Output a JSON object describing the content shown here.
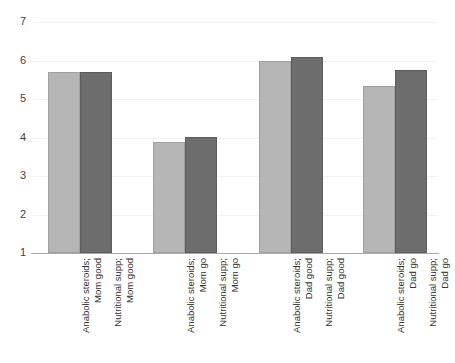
{
  "chart_data": {
    "type": "bar",
    "title": "",
    "subtitle": "",
    "xlabel": "",
    "ylabel": "",
    "ylim": [
      1,
      7
    ],
    "yticks": [
      1,
      2,
      3,
      4,
      5,
      6,
      7
    ],
    "ytick_labels": [
      "1",
      "2",
      "3",
      "4",
      "5",
      "6",
      "7"
    ],
    "grid": true,
    "legend": "none",
    "orientation": "vertical",
    "bar_colors": {
      "light": "#b6b6b6",
      "dark": "#6d6d6d"
    },
    "axis_color": "#a8a8a8",
    "gridline_color": "#f2f2f2",
    "categories": [
      "Anabolic steroids; Mom good",
      "Nutritional supp; Mom good",
      "Anabolic steroids; Mom go",
      "Nutritional supp; Mom go",
      "Anabolic steroids; Dad good",
      "Nutritional supp; Dad good",
      "Anabolic steroids; Dad go",
      "Nutritional supp; Dad go"
    ],
    "values": [
      5.7,
      5.7,
      3.88,
      4.02,
      6.0,
      6.1,
      5.35,
      5.75
    ],
    "groups": [
      {
        "bars": [
          {
            "line1": "Anabolic steroids;",
            "line2": "Mom good",
            "value": 5.7,
            "shade": "light"
          },
          {
            "line1": "Nutritional supp;",
            "line2": "Mom good",
            "value": 5.7,
            "shade": "dark"
          }
        ]
      },
      {
        "bars": [
          {
            "line1": "Anabolic steroids;",
            "line2": "Mom go",
            "value": 3.88,
            "shade": "light"
          },
          {
            "line1": "Nutritional supp;",
            "line2": "Mom go",
            "value": 4.02,
            "shade": "dark"
          }
        ]
      },
      {
        "bars": [
          {
            "line1": "Anabolic steroids;",
            "line2": "Dad good",
            "value": 6.0,
            "shade": "light"
          },
          {
            "line1": "Nutritional supp;",
            "line2": "Dad good",
            "value": 6.1,
            "shade": "dark"
          }
        ]
      },
      {
        "bars": [
          {
            "line1": "Anabolic steroids;",
            "line2": "Dad go",
            "value": 5.35,
            "shade": "light"
          },
          {
            "line1": "Nutritional supp;",
            "line2": "Dad go",
            "value": 5.75,
            "shade": "dark"
          }
        ]
      }
    ]
  }
}
